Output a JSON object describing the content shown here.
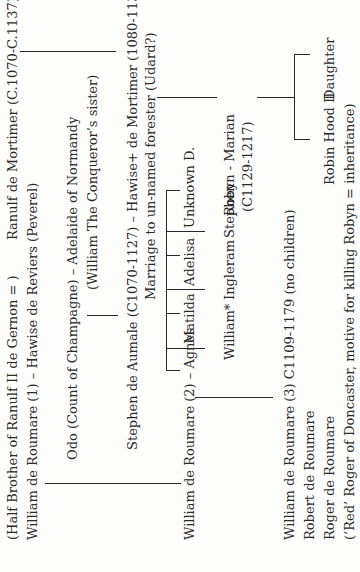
{
  "document": {
    "type": "family-tree",
    "orientation": "rotated-90-ccw",
    "generation1": {
      "ranulf": "Ranulf de Mortimer (C.1070-C.1137)",
      "half_brother_note": "(Half Brother of Ranulf II de Gernon = )",
      "william1": "William de Roumare (1) – Hawise de Reviers (Peverel)"
    },
    "generation2": {
      "odo": "Odo (Count of Champagne) – Adelaide of Normandy",
      "adelaide_note": "(William The Conqueror’s sister)"
    },
    "generation3": {
      "stephen_aumale": "Stephen de Aumale (C1070-1127) – Hawise+ de Mortimer (1080-1130?)",
      "marriage_note": "Marriage to un-named forester (Udard?)"
    },
    "generation4": {
      "william2": "William de Roumare (2) – Agnes",
      "daughters": [
        "Matilda",
        "Adelisa",
        "Unknown D."
      ],
      "sons": [
        "William*",
        "Ingleram",
        "Stephen"
      ],
      "robyn": "Robyn - Marian",
      "robyn_dates": "(C1129-1217)"
    },
    "generation5": {
      "william3": "William de Roumare (3) C1109-1179 (no children)",
      "robert": "Robert de Roumare",
      "roger": "Roger de Roumare",
      "red_roger_note": "(‘Red’ Roger of Doncaster, motive for killing Robyn = inheritance)",
      "robin_hood_ii": "Robin Hood II",
      "daughter": "Daughter"
    }
  }
}
